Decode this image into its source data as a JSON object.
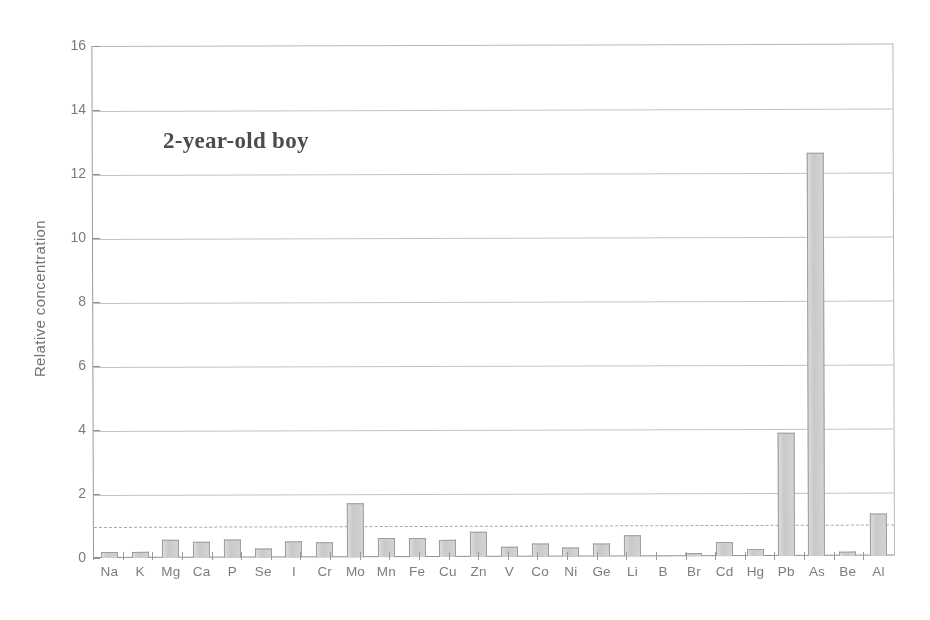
{
  "chart_data": {
    "type": "bar",
    "title": "",
    "annotation": "2-year-old boy",
    "xlabel": "",
    "ylabel": "Relative concentration",
    "ylim": [
      0,
      16
    ],
    "yticks": [
      0,
      2,
      4,
      6,
      8,
      10,
      12,
      14,
      16
    ],
    "grid": true,
    "legend": "none",
    "reference_line": {
      "value": 1.0,
      "style": "dashed",
      "color": "#a9a9a9"
    },
    "bar_color": "#cfcfcf",
    "bar_edge_color": "#9d9d9d",
    "categories": [
      "Na",
      "K",
      "Mg",
      "Ca",
      "P",
      "Se",
      "I",
      "Cr",
      "Mo",
      "Mn",
      "Fe",
      "Cu",
      "Zn",
      "V",
      "Co",
      "Ni",
      "Ge",
      "Li",
      "B",
      "Br",
      "Cd",
      "Hg",
      "Pb",
      "As",
      "Be",
      "Al"
    ],
    "values": [
      0.2,
      0.2,
      0.55,
      0.5,
      0.55,
      0.28,
      0.5,
      0.48,
      1.7,
      0.58,
      0.6,
      0.52,
      0.78,
      0.32,
      0.42,
      0.28,
      0.42,
      0.65,
      0.03,
      0.1,
      0.45,
      0.22,
      3.85,
      12.6,
      0.12,
      1.3
    ]
  },
  "axis": {
    "y_title": "Relative concentration",
    "y_tick_labels": [
      "16",
      "14",
      "12",
      "10",
      "8",
      "6",
      "4",
      "2",
      "0"
    ]
  }
}
